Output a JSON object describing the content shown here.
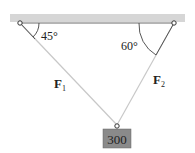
{
  "diagram": {
    "angle_left": "45°",
    "angle_right": "60°",
    "force_left": "F",
    "force_left_sub": "1",
    "force_right": "F",
    "force_right_sub": "2",
    "weight": "300",
    "colors": {
      "ceiling": "#d6d6d6",
      "rope": "#c8c8c8",
      "box": "#8a8a8a",
      "ink": "#333333"
    }
  }
}
